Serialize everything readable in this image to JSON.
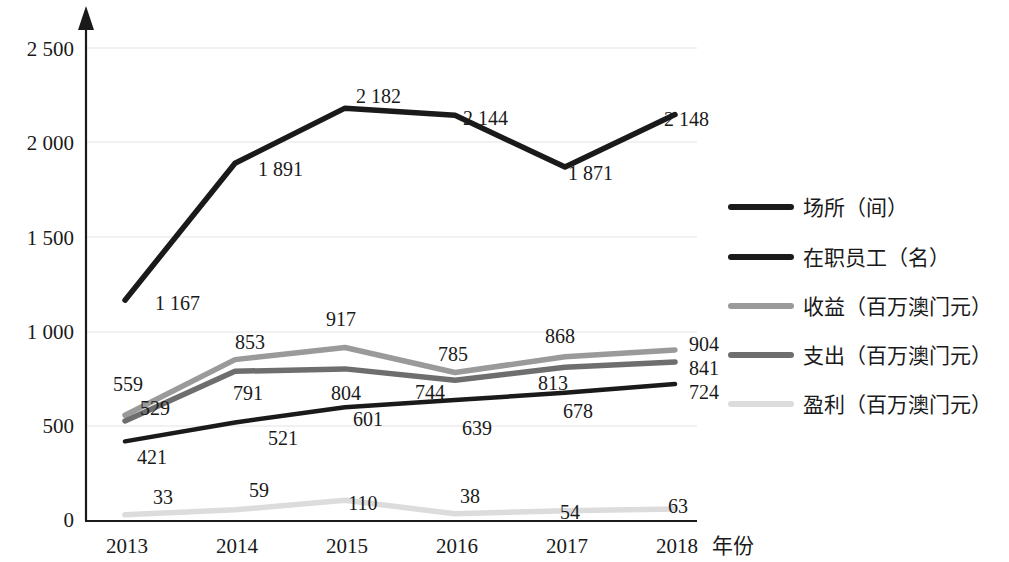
{
  "chart_data": {
    "type": "line",
    "title": "",
    "xlabel": "年份",
    "ylabel": "",
    "categories": [
      "2013",
      "2014",
      "2015",
      "2016",
      "2017",
      "2018"
    ],
    "ylim": [
      0,
      2700
    ],
    "yticks": [
      "0",
      "500",
      "1 000",
      "1 500",
      "2 000",
      "2 500"
    ],
    "ytick_values": [
      0,
      500,
      1000,
      1500,
      2000,
      2500
    ],
    "grid": true,
    "legend_position": "right",
    "series": [
      {
        "name": "场所（间）",
        "color": "#1a1a1a",
        "width": 5.5,
        "values": [
          1167,
          1891,
          2182,
          2144,
          1871,
          2148
        ],
        "labels": [
          "1 167",
          "1 891",
          "2 182",
          "2 144",
          "1 871",
          "2 148"
        ]
      },
      {
        "name": "在职员工（名）",
        "color": "#1a1a1a",
        "width": 4.5,
        "values": [
          421,
          521,
          601,
          639,
          678,
          724
        ],
        "labels": [
          "421",
          "521",
          "601",
          "639",
          "678",
          "724"
        ]
      },
      {
        "name": "收益（百万澳门元）",
        "color": "#9a9a9a",
        "width": 5.5,
        "values": [
          559,
          853,
          917,
          785,
          868,
          904
        ],
        "labels": [
          "559",
          "853",
          "917",
          "785",
          "868",
          "904"
        ]
      },
      {
        "name": "支出（百万澳门元）",
        "color": "#6e6e6e",
        "width": 5.5,
        "values": [
          529,
          791,
          804,
          744,
          813,
          841
        ],
        "labels": [
          "529",
          "791",
          "804",
          "744",
          "813",
          "841"
        ]
      },
      {
        "name": "盈利（百万澳门元）",
        "color": "#dcdcdc",
        "width": 5.5,
        "values": [
          33,
          59,
          110,
          38,
          54,
          63
        ],
        "labels": [
          "33",
          "59",
          "110",
          "38",
          "54",
          "63"
        ]
      }
    ]
  },
  "yaxis": {
    "t0": "0",
    "t1": "500",
    "t2": "1 000",
    "t3": "1 500",
    "t4": "2 000",
    "t5": "2 500"
  },
  "xaxis": {
    "c0": "2013",
    "c1": "2014",
    "c2": "2015",
    "c3": "2016",
    "c4": "2017",
    "c5": "2018",
    "title": "年份"
  },
  "labels": {
    "venues": {
      "v0": "1 167",
      "v1": "1 891",
      "v2": "2 182",
      "v3": "2 144",
      "v4": "1 871",
      "v5": "2 148"
    },
    "staff": {
      "v0": "421",
      "v1": "521",
      "v2": "601",
      "v3": "639",
      "v4": "678",
      "v5": "724"
    },
    "revenue": {
      "v0": "559",
      "v1": "853",
      "v2": "917",
      "v3": "785",
      "v4": "868",
      "v5": "904"
    },
    "expense": {
      "v0": "529",
      "v1": "791",
      "v2": "804",
      "v3": "744",
      "v4": "813",
      "v5": "841"
    },
    "profit": {
      "v0": "33",
      "v1": "59",
      "v2": "110",
      "v3": "38",
      "v4": "54",
      "v5": "63"
    }
  },
  "legend": {
    "i0": "场所（间）",
    "i1": "在职员工（名）",
    "i2": "收益（百万澳门元）",
    "i3": "支出（百万澳门元）",
    "i4": "盈利（百万澳门元）"
  }
}
